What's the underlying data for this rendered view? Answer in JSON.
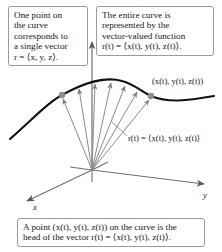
{
  "figure": {
    "background": "#ffffff"
  },
  "callouts": {
    "left": {
      "lines": [
        "One point on",
        "the curve",
        "corresponds to",
        "a single vector",
        "r = ⟨x, y, z⟩."
      ],
      "border_color": "#9a9a9a"
    },
    "right": {
      "lines": [
        "The entire curve is",
        "represented by the",
        "vector-valued function",
        "r(t) = ⟨x(t), y(t), z(t)⟩."
      ],
      "border_color": "#9a9a9a"
    },
    "bottom": {
      "lines": [
        "A point (x(t), y(t), z(t)) on the curve is the",
        "head of the vector r(t) = ⟨x(t), y(t), z(t)⟩."
      ],
      "border_color": "#9a9a9a"
    }
  },
  "axes": {
    "z_label": "z",
    "y_label": "y",
    "x_label": "x",
    "color": "#6b6b6b",
    "origin": {
      "x": 92,
      "y": 170
    }
  },
  "annotations": {
    "curve_point_label": "(x(t), y(t), z(t))",
    "vector_label": "r(t) = ⟨x(t), y(t), z(t)⟩"
  },
  "curve": {
    "color": "#111111",
    "stroke_width": 2.0,
    "description": "space curve arcing over the z axis with a dip on the right"
  },
  "vectors": {
    "count": 7,
    "color": "#8a8a8a",
    "stroke_width": 1.0,
    "endpoints": [
      {
        "x": 62,
        "y": 95
      },
      {
        "x": 78,
        "y": 85
      },
      {
        "x": 95,
        "y": 80
      },
      {
        "x": 112,
        "y": 79
      },
      {
        "x": 126,
        "y": 82
      },
      {
        "x": 138,
        "y": 88
      },
      {
        "x": 151,
        "y": 96
      }
    ]
  },
  "point_markers": {
    "color": "#8e8e8e",
    "radius": 3,
    "points": [
      {
        "x": 62,
        "y": 95
      },
      {
        "x": 151,
        "y": 96
      }
    ]
  }
}
